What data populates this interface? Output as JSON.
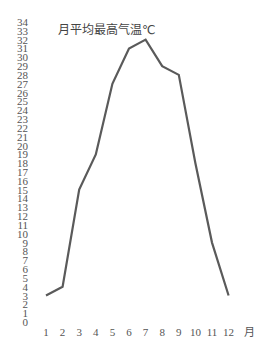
{
  "chart_data": {
    "type": "line",
    "title": "月平均最高气温℃",
    "xlabel": "月",
    "ylabel": "",
    "categories": [
      "1",
      "2",
      "3",
      "4",
      "5",
      "6",
      "7",
      "8",
      "9",
      "10",
      "11",
      "12"
    ],
    "series": [
      {
        "name": "月平均最高气温",
        "values": [
          3,
          4,
          15,
          19,
          27,
          31,
          32,
          29,
          28,
          18,
          9,
          3
        ],
        "color": "#5a5a5a"
      }
    ],
    "ylim": [
      0,
      34
    ],
    "yticks": [
      0,
      1,
      2,
      3,
      4,
      5,
      6,
      7,
      8,
      9,
      10,
      11,
      12,
      13,
      14,
      15,
      16,
      17,
      18,
      19,
      20,
      21,
      22,
      23,
      24,
      25,
      26,
      27,
      28,
      29,
      30,
      31,
      32,
      33,
      34
    ],
    "grid": false,
    "legend": "none"
  }
}
